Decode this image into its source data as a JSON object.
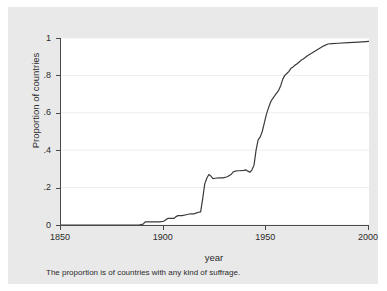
{
  "chart_data": {
    "type": "line",
    "title": "",
    "xlabel": "year",
    "ylabel": "Proportion of countries",
    "note": "The proportion is of countries with any kind of suffrage.",
    "xlim": [
      1850,
      2000
    ],
    "ylim": [
      0,
      1
    ],
    "grid": true,
    "legend": "none",
    "xticks": [
      1850,
      1900,
      1950,
      2000
    ],
    "xtick_labels": [
      "1850",
      "1900",
      "1950",
      "2000"
    ],
    "yticks": [
      0,
      0.2,
      0.4,
      0.6,
      0.8,
      1
    ],
    "ytick_labels": [
      "0",
      ".2",
      ".4",
      ".6",
      ".8",
      "1"
    ],
    "line_color": "#3a3a3a",
    "background_color": "#e9e9e9",
    "plot_background_color": "#ffffff",
    "grid_color": "#ededed",
    "axis_color": "#4a4a4a",
    "series": [
      {
        "name": "Proportion of countries with any kind of suffrage",
        "x": [
          1850,
          1860,
          1870,
          1880,
          1888,
          1890,
          1891,
          1893,
          1895,
          1898,
          1900,
          1902,
          1905,
          1906,
          1907,
          1909,
          1911,
          1913,
          1915,
          1916,
          1917,
          1918,
          1919,
          1920,
          1921,
          1922,
          1923,
          1924,
          1925,
          1927,
          1929,
          1931,
          1933,
          1934,
          1935,
          1936,
          1937,
          1939,
          1940,
          1941,
          1942,
          1943,
          1944,
          1945,
          1946,
          1947,
          1948,
          1949,
          1950,
          1951,
          1952,
          1953,
          1954,
          1955,
          1956,
          1957,
          1958,
          1959,
          1960,
          1961,
          1962,
          1963,
          1964,
          1965,
          1966,
          1967,
          1968,
          1970,
          1972,
          1974,
          1976,
          1978,
          1980,
          1982,
          1985,
          1990,
          1995,
          2000
        ],
        "y": [
          0.0,
          0.0,
          0.0,
          0.0,
          0.0,
          0.005,
          0.017,
          0.017,
          0.017,
          0.017,
          0.02,
          0.035,
          0.035,
          0.045,
          0.05,
          0.05,
          0.055,
          0.06,
          0.06,
          0.065,
          0.068,
          0.07,
          0.14,
          0.22,
          0.25,
          0.27,
          0.262,
          0.248,
          0.25,
          0.252,
          0.252,
          0.258,
          0.272,
          0.285,
          0.288,
          0.29,
          0.29,
          0.292,
          0.295,
          0.288,
          0.282,
          0.295,
          0.32,
          0.4,
          0.455,
          0.47,
          0.5,
          0.545,
          0.59,
          0.625,
          0.655,
          0.675,
          0.69,
          0.705,
          0.72,
          0.745,
          0.78,
          0.8,
          0.81,
          0.822,
          0.838,
          0.845,
          0.855,
          0.862,
          0.872,
          0.882,
          0.888,
          0.905,
          0.918,
          0.932,
          0.945,
          0.958,
          0.968,
          0.97,
          0.972,
          0.975,
          0.978,
          0.982
        ]
      }
    ]
  }
}
